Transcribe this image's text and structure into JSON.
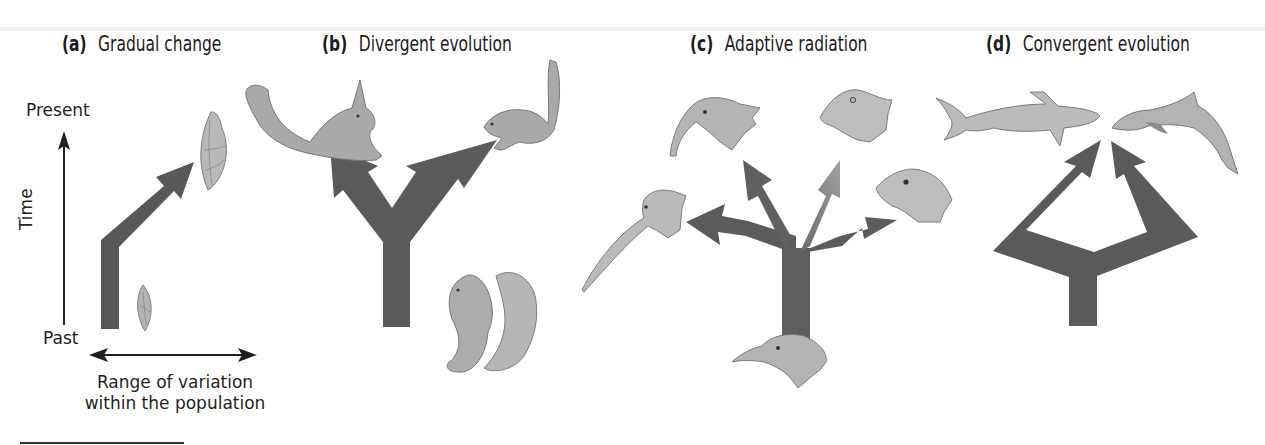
{
  "figure": {
    "panels": [
      {
        "id": "a",
        "letter": "(a)",
        "title": "Gradual change",
        "axis": {
          "y_label": "Time",
          "y_top": "Present",
          "y_bottom": "Past",
          "x_caption_line1": "Range of variation",
          "x_caption_line2": "within the population"
        },
        "organisms": [
          "small shell (past)",
          "larger shell (present)"
        ]
      },
      {
        "id": "b",
        "letter": "(b)",
        "title": "Divergent evolution",
        "organisms": [
          "ancestral squirrel",
          "tassel-eared squirrel",
          "long-tailed squirrel"
        ]
      },
      {
        "id": "c",
        "letter": "(c)",
        "title": "Adaptive radiation",
        "organisms": [
          "ancestral bird head",
          "long curved-bill bird",
          "hooked-bill bird",
          "thick-bill bird",
          "short-bill bird"
        ]
      },
      {
        "id": "d",
        "letter": "(d)",
        "title": "Convergent evolution",
        "organisms": [
          "shark",
          "dolphin"
        ]
      }
    ],
    "colors": {
      "arrow": "#58585a",
      "arrow_light": "#8a8a8c",
      "organism_fill": "#b5b5b5",
      "organism_stroke": "#7a7a7a",
      "text": "#231f20"
    }
  }
}
